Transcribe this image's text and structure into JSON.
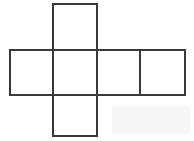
{
  "figure": {
    "background_color": "#ffffff",
    "stroke_color": "#3a3a3a",
    "face_fill_color": "#ffffff",
    "stroke_width": 2,
    "canvas": {
      "width": 194,
      "height": 141
    },
    "geometry": {
      "square_size": 44,
      "column_x": [
        10,
        53,
        97,
        140,
        185
      ],
      "row_y": [
        4,
        50,
        95,
        136
      ]
    },
    "faces": [
      {
        "id": "face-top",
        "label": "",
        "x": 53,
        "y": 4,
        "width": 44,
        "height": 46,
        "position": "top"
      },
      {
        "id": "face-row-1",
        "label": "",
        "x": 10,
        "y": 50,
        "width": 43,
        "height": 45,
        "position": "middle-left"
      },
      {
        "id": "face-row-2",
        "label": "",
        "x": 53,
        "y": 50,
        "width": 44,
        "height": 45,
        "position": "middle-center-left"
      },
      {
        "id": "face-row-3",
        "label": "",
        "x": 97,
        "y": 50,
        "width": 43,
        "height": 45,
        "position": "middle-center-right"
      },
      {
        "id": "face-row-4",
        "label": "",
        "x": 140,
        "y": 50,
        "width": 45,
        "height": 45,
        "position": "middle-right"
      },
      {
        "id": "face-bottom",
        "label": "",
        "x": 53,
        "y": 95,
        "width": 44,
        "height": 41,
        "position": "bottom"
      }
    ],
    "artifact": {
      "name": "scan-smudge",
      "color": "#f4f4f4",
      "x": 112,
      "y": 106,
      "width": 78,
      "height": 28
    }
  }
}
